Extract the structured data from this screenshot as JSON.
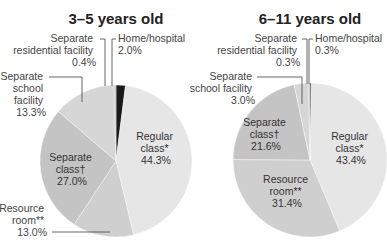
{
  "chart_data": [
    {
      "type": "pie",
      "title": "3–5 years old",
      "categories": [
        "Home/hospital",
        "Regular class*",
        "Resource room**",
        "Separate class†",
        "Separate school facility",
        "Separate residential facility"
      ],
      "values": [
        2.0,
        44.3,
        13.0,
        27.0,
        13.3,
        0.4
      ],
      "labels": {
        "home": [
          "Home/hospital",
          "2.0%"
        ],
        "regular": [
          "Regular",
          "class*",
          "44.3%"
        ],
        "resource": [
          "Resource",
          "room**",
          "13.0%"
        ],
        "sepclass": [
          "Separate",
          "class†",
          "27.0%"
        ],
        "sepschool": [
          "Separate",
          "school",
          "facility",
          "13.3%"
        ],
        "residential": [
          "Separate",
          "residential facility",
          "0.4%"
        ]
      }
    },
    {
      "type": "pie",
      "title": "6–11 years old",
      "categories": [
        "Home/hospital",
        "Regular class*",
        "Resource room**",
        "Separate class†",
        "Separate school facility",
        "Separate residential facility"
      ],
      "values": [
        0.3,
        43.4,
        31.4,
        21.6,
        3.0,
        0.3
      ],
      "labels": {
        "home": [
          "Home/hospital",
          "0.3%"
        ],
        "regular": [
          "Regular",
          "class*",
          "43.4%"
        ],
        "resource": [
          "Resource",
          "room**",
          "31.4%"
        ],
        "sepclass": [
          "Separate",
          "class†",
          "21.6%"
        ],
        "sepschool": [
          "Separate",
          "school facility",
          "3.0%"
        ],
        "residential": [
          "Separate",
          "residential facility",
          "0.3%"
        ]
      }
    }
  ],
  "colors": {
    "home": "#1a1a1a",
    "regular": "#e6e6e6",
    "resource": "#cfcfcf",
    "sepclass": "#c4c4c4",
    "sepschool": "#d6d6d6",
    "residential": "#bdbdbd"
  }
}
